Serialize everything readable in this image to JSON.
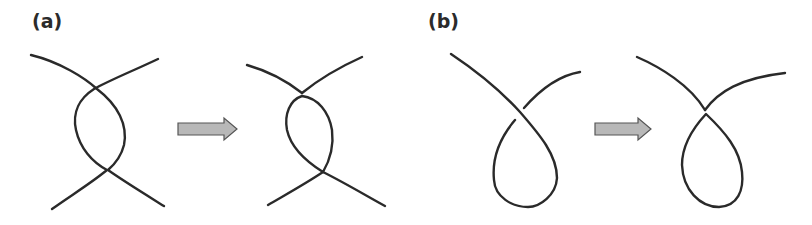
{
  "panels": [
    {
      "label": "(a)",
      "description": "Two strands crossing twice (twisted pair with two crossings) transformed into a configuration with a closed loop and two touching vertices",
      "before": "two-crossing twist",
      "after": "loop with two tangent points"
    },
    {
      "label": "(b)",
      "description": "Single strand with a self-crossing loop transformed into a curve with a touching point forming a closed loop",
      "before": "single crossing kink loop",
      "after": "tangent loop (vertex touching)"
    }
  ],
  "arrows": [
    {
      "direction": "right",
      "fill": "#b8b8b8",
      "stroke": "#555555"
    },
    {
      "direction": "right",
      "fill": "#b8b8b8",
      "stroke": "#555555"
    }
  ],
  "colors": {
    "stroke": "#2a2a2a",
    "background": "#ffffff"
  }
}
